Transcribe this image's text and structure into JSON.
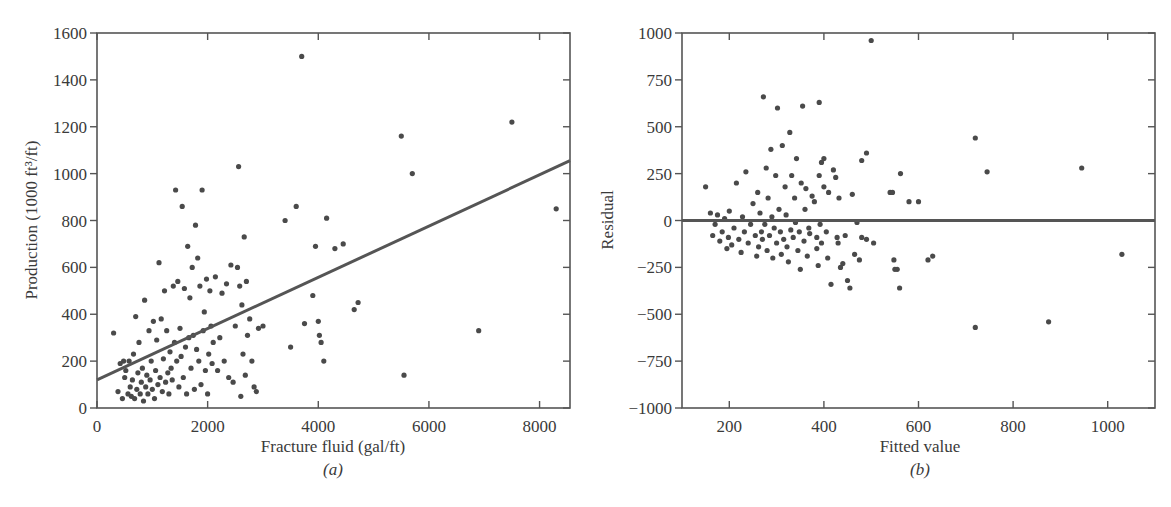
{
  "chart_data": [
    {
      "id": "a",
      "type": "scatter",
      "caption": "(a)",
      "title": "",
      "xlabel": "Fracture fluid (gal/ft)",
      "ylabel": "Production (1000 ft³/ft)",
      "xlim": [
        0,
        8550
      ],
      "ylim": [
        0,
        1600
      ],
      "xticks": [
        0,
        2000,
        4000,
        6000,
        8000
      ],
      "yticks": [
        0,
        200,
        400,
        600,
        800,
        1000,
        1200,
        1400,
        1600
      ],
      "grid": false,
      "legend": null,
      "fit_line": {
        "x": [
          0,
          8550
        ],
        "y": [
          120,
          1055
        ]
      },
      "series": [
        {
          "name": "wells",
          "points": [
            [
              300,
              320
            ],
            [
              380,
              70
            ],
            [
              420,
              190
            ],
            [
              460,
              40
            ],
            [
              480,
              200
            ],
            [
              500,
              130
            ],
            [
              520,
              160
            ],
            [
              560,
              60
            ],
            [
              580,
              200
            ],
            [
              600,
              90
            ],
            [
              620,
              50
            ],
            [
              640,
              120
            ],
            [
              660,
              230
            ],
            [
              680,
              40
            ],
            [
              700,
              390
            ],
            [
              720,
              80
            ],
            [
              740,
              150
            ],
            [
              760,
              280
            ],
            [
              780,
              60
            ],
            [
              800,
              110
            ],
            [
              820,
              170
            ],
            [
              840,
              30
            ],
            [
              860,
              460
            ],
            [
              880,
              90
            ],
            [
              900,
              140
            ],
            [
              920,
              60
            ],
            [
              940,
              330
            ],
            [
              960,
              120
            ],
            [
              980,
              200
            ],
            [
              1000,
              80
            ],
            [
              1020,
              370
            ],
            [
              1040,
              40
            ],
            [
              1060,
              160
            ],
            [
              1080,
              290
            ],
            [
              1100,
              100
            ],
            [
              1120,
              620
            ],
            [
              1140,
              130
            ],
            [
              1160,
              380
            ],
            [
              1180,
              70
            ],
            [
              1200,
              210
            ],
            [
              1220,
              500
            ],
            [
              1240,
              110
            ],
            [
              1260,
              330
            ],
            [
              1280,
              150
            ],
            [
              1300,
              60
            ],
            [
              1320,
              240
            ],
            [
              1340,
              170
            ],
            [
              1360,
              120
            ],
            [
              1380,
              520
            ],
            [
              1400,
              280
            ],
            [
              1420,
              930
            ],
            [
              1440,
              200
            ],
            [
              1460,
              540
            ],
            [
              1480,
              90
            ],
            [
              1500,
              340
            ],
            [
              1520,
              220
            ],
            [
              1540,
              860
            ],
            [
              1560,
              130
            ],
            [
              1580,
              510
            ],
            [
              1600,
              260
            ],
            [
              1620,
              60
            ],
            [
              1640,
              690
            ],
            [
              1660,
              300
            ],
            [
              1680,
              470
            ],
            [
              1700,
              170
            ],
            [
              1720,
              600
            ],
            [
              1740,
              310
            ],
            [
              1760,
              80
            ],
            [
              1780,
              780
            ],
            [
              1800,
              250
            ],
            [
              1820,
              640
            ],
            [
              1840,
              200
            ],
            [
              1860,
              520
            ],
            [
              1880,
              100
            ],
            [
              1900,
              930
            ],
            [
              1920,
              330
            ],
            [
              1940,
              410
            ],
            [
              1960,
              160
            ],
            [
              1980,
              550
            ],
            [
              2000,
              60
            ],
            [
              2020,
              230
            ],
            [
              2040,
              500
            ],
            [
              2060,
              350
            ],
            [
              2080,
              190
            ],
            [
              2100,
              280
            ],
            [
              2140,
              560
            ],
            [
              2180,
              160
            ],
            [
              2220,
              300
            ],
            [
              2260,
              490
            ],
            [
              2300,
              200
            ],
            [
              2340,
              530
            ],
            [
              2380,
              130
            ],
            [
              2420,
              610
            ],
            [
              2460,
              110
            ],
            [
              2500,
              350
            ],
            [
              2540,
              600
            ],
            [
              2560,
              1030
            ],
            [
              2580,
              520
            ],
            [
              2600,
              50
            ],
            [
              2620,
              440
            ],
            [
              2640,
              230
            ],
            [
              2660,
              730
            ],
            [
              2680,
              140
            ],
            [
              2700,
              540
            ],
            [
              2720,
              310
            ],
            [
              2760,
              380
            ],
            [
              2800,
              200
            ],
            [
              2840,
              90
            ],
            [
              2880,
              70
            ],
            [
              2920,
              340
            ],
            [
              3000,
              350
            ],
            [
              3400,
              800
            ],
            [
              3500,
              260
            ],
            [
              3600,
              860
            ],
            [
              3700,
              1500
            ],
            [
              3750,
              360
            ],
            [
              3900,
              480
            ],
            [
              3950,
              690
            ],
            [
              4000,
              370
            ],
            [
              4020,
              310
            ],
            [
              4050,
              280
            ],
            [
              4100,
              200
            ],
            [
              4150,
              810
            ],
            [
              4300,
              680
            ],
            [
              4450,
              700
            ],
            [
              4650,
              420
            ],
            [
              4720,
              450
            ],
            [
              5500,
              1160
            ],
            [
              5550,
              140
            ],
            [
              5700,
              1000
            ],
            [
              6900,
              330
            ],
            [
              7500,
              1220
            ],
            [
              8300,
              850
            ]
          ]
        }
      ]
    },
    {
      "id": "b",
      "type": "scatter",
      "caption": "(b)",
      "title": "",
      "xlabel": "Fitted value",
      "ylabel": "Residual",
      "xlim": [
        100,
        1100
      ],
      "ylim": [
        -1000,
        1000
      ],
      "xticks": [
        200,
        400,
        600,
        800,
        1000
      ],
      "yticks": [
        -1000,
        -750,
        -500,
        -250,
        0,
        250,
        500,
        750,
        1000
      ],
      "ytick_labels": [
        "−1000",
        "−750",
        "−500",
        "−250",
        "0",
        "250",
        "500",
        "750",
        "1000"
      ],
      "grid": false,
      "legend": null,
      "zero_line": 0,
      "series": [
        {
          "name": "residuals",
          "points": [
            [
              150,
              180
            ],
            [
              160,
              40
            ],
            [
              165,
              -80
            ],
            [
              170,
              -20
            ],
            [
              175,
              30
            ],
            [
              180,
              -110
            ],
            [
              185,
              -60
            ],
            [
              190,
              10
            ],
            [
              195,
              -150
            ],
            [
              198,
              -90
            ],
            [
              200,
              50
            ],
            [
              205,
              -130
            ],
            [
              210,
              -40
            ],
            [
              215,
              200
            ],
            [
              220,
              -100
            ],
            [
              225,
              -170
            ],
            [
              228,
              20
            ],
            [
              232,
              -60
            ],
            [
              235,
              260
            ],
            [
              240,
              -120
            ],
            [
              245,
              -20
            ],
            [
              250,
              90
            ],
            [
              255,
              -80
            ],
            [
              258,
              -190
            ],
            [
              260,
              150
            ],
            [
              262,
              -140
            ],
            [
              265,
              40
            ],
            [
              268,
              -60
            ],
            [
              270,
              -100
            ],
            [
              272,
              660
            ],
            [
              275,
              -20
            ],
            [
              278,
              280
            ],
            [
              280,
              -160
            ],
            [
              282,
              120
            ],
            [
              285,
              -80
            ],
            [
              288,
              380
            ],
            [
              290,
              20
            ],
            [
              292,
              -200
            ],
            [
              295,
              -40
            ],
            [
              298,
              240
            ],
            [
              300,
              -120
            ],
            [
              302,
              600
            ],
            [
              305,
              60
            ],
            [
              308,
              -60
            ],
            [
              310,
              -180
            ],
            [
              312,
              400
            ],
            [
              315,
              -100
            ],
            [
              318,
              180
            ],
            [
              320,
              30
            ],
            [
              322,
              -140
            ],
            [
              325,
              -220
            ],
            [
              328,
              470
            ],
            [
              330,
              -50
            ],
            [
              332,
              240
            ],
            [
              335,
              -90
            ],
            [
              338,
              120
            ],
            [
              340,
              -10
            ],
            [
              342,
              330
            ],
            [
              345,
              -160
            ],
            [
              348,
              -60
            ],
            [
              350,
              -260
            ],
            [
              352,
              200
            ],
            [
              355,
              610
            ],
            [
              358,
              -110
            ],
            [
              360,
              60
            ],
            [
              362,
              170
            ],
            [
              365,
              -190
            ],
            [
              368,
              -40
            ],
            [
              370,
              -70
            ],
            [
              375,
              130
            ],
            [
              380,
              100
            ],
            [
              385,
              -150
            ],
            [
              388,
              -240
            ],
            [
              390,
              240
            ],
            [
              392,
              -20
            ],
            [
              395,
              -120
            ],
            [
              400,
              180
            ],
            [
              405,
              -60
            ],
            [
              408,
              -200
            ],
            [
              410,
              150
            ],
            [
              415,
              -340
            ],
            [
              420,
              270
            ],
            [
              425,
              230
            ],
            [
              428,
              -90
            ],
            [
              430,
              -120
            ],
            [
              432,
              120
            ],
            [
              435,
              -250
            ],
            [
              440,
              -230
            ],
            [
              445,
              -80
            ],
            [
              450,
              -320
            ],
            [
              455,
              -360
            ],
            [
              460,
              140
            ],
            [
              465,
              -180
            ],
            [
              385,
              -90
            ],
            [
              390,
              630
            ],
            [
              395,
              310
            ],
            [
              400,
              330
            ],
            [
              470,
              -10
            ],
            [
              480,
              -90
            ],
            [
              490,
              -100
            ],
            [
              475,
              -210
            ],
            [
              480,
              320
            ],
            [
              490,
              360
            ],
            [
              500,
              960
            ],
            [
              505,
              -120
            ],
            [
              540,
              150
            ],
            [
              545,
              150
            ],
            [
              548,
              -210
            ],
            [
              550,
              -260
            ],
            [
              555,
              -260
            ],
            [
              560,
              -360
            ],
            [
              562,
              250
            ],
            [
              580,
              100
            ],
            [
              600,
              100
            ],
            [
              620,
              -210
            ],
            [
              630,
              -190
            ],
            [
              720,
              440
            ],
            [
              720,
              -570
            ],
            [
              745,
              260
            ],
            [
              875,
              -540
            ],
            [
              945,
              280
            ],
            [
              1030,
              -180
            ]
          ]
        }
      ]
    }
  ]
}
